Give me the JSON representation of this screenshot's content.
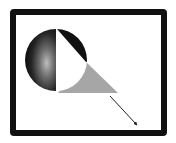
{
  "diagram": {
    "frame": {
      "color": "#111111",
      "background": "#ffffff"
    },
    "shapes": [
      {
        "type": "circle",
        "name": "sphere",
        "cx": 56,
        "cy": 60,
        "r": 31,
        "left_fill": "radial-gradient dark",
        "right_fill": "#ffffff"
      },
      {
        "type": "wedge",
        "name": "black-wedge",
        "color": "#111111"
      },
      {
        "type": "triangle",
        "name": "grey-triangle",
        "color": "#a6a6a6"
      },
      {
        "type": "arrow",
        "name": "arrow",
        "from": [
          110,
          96
        ],
        "to": [
          137,
          125
        ],
        "color": "#222222"
      }
    ]
  }
}
